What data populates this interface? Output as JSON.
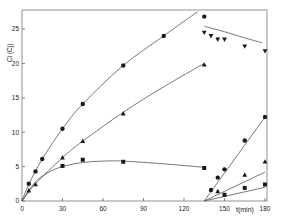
{
  "chart_data": {
    "type": "scatter",
    "title": "",
    "xlabel": "t(min)",
    "ylabel": "Ci (Cj)",
    "xlim": [
      0,
      180
    ],
    "ylim": [
      0,
      27
    ],
    "x_ticks": [
      0,
      30,
      60,
      90,
      120,
      150,
      180
    ],
    "y_ticks": [
      0,
      5,
      10,
      15,
      20,
      25
    ],
    "grid": false,
    "legend": null,
    "colors": {
      "ink": "#1a1a1a",
      "line": "#555555",
      "background": "#ffffff"
    },
    "series": [
      {
        "name": "circles",
        "marker": "circle",
        "x": [
          5,
          10,
          15,
          30,
          45,
          75,
          105,
          135
        ],
        "y": [
          2.5,
          4.3,
          6.1,
          10.5,
          14.1,
          19.7,
          24.0,
          26.8
        ],
        "fit": [
          [
            0,
            0
          ],
          [
            5,
            2.4
          ],
          [
            15,
            6.1
          ],
          [
            30,
            10.5
          ],
          [
            45,
            14.1
          ],
          [
            75,
            19.7
          ],
          [
            105,
            24.0
          ],
          [
            130,
            27.5
          ]
        ]
      },
      {
        "name": "triangles-up",
        "marker": "triangle-up",
        "x": [
          5,
          10,
          30,
          45,
          75,
          135
        ],
        "y": [
          1.5,
          2.4,
          6.3,
          8.7,
          12.7,
          19.8
        ],
        "fit": [
          [
            0,
            0
          ],
          [
            10,
            2.5
          ],
          [
            30,
            6.3
          ],
          [
            45,
            8.7
          ],
          [
            75,
            12.9
          ],
          [
            105,
            16.6
          ],
          [
            135,
            20.0
          ]
        ]
      },
      {
        "name": "squares",
        "marker": "square",
        "x": [
          30,
          45,
          75,
          135
        ],
        "y": [
          5.1,
          6.0,
          5.7,
          4.8
        ],
        "fit": [
          [
            0,
            0
          ],
          [
            10,
            2.8
          ],
          [
            20,
            4.2
          ],
          [
            30,
            5.0
          ],
          [
            45,
            5.6
          ],
          [
            60,
            5.8
          ],
          [
            75,
            5.8
          ],
          [
            105,
            5.4
          ],
          [
            135,
            4.9
          ]
        ]
      },
      {
        "name": "triangles-down",
        "marker": "triangle-down",
        "x": [
          135,
          140,
          145,
          150,
          165,
          180
        ],
        "y": [
          24.5,
          24.0,
          23.5,
          23.5,
          22.5,
          21.8
        ],
        "fit": [
          [
            135,
            25.4
          ],
          [
            150,
            24.6
          ],
          [
            165,
            23.7
          ],
          [
            178,
            23.0
          ]
        ]
      },
      {
        "name": "circles-phase2",
        "marker": "circle",
        "x": [
          140,
          145,
          150,
          165,
          180
        ],
        "y": [
          1.6,
          3.4,
          4.6,
          8.8,
          12.2
        ],
        "fit": [
          [
            135,
            0
          ],
          [
            180,
            12.2
          ]
        ]
      },
      {
        "name": "triangles-up-phase2",
        "marker": "triangle-up",
        "x": [
          145,
          165,
          180
        ],
        "y": [
          1.4,
          3.8,
          5.7
        ],
        "fit": [
          [
            135,
            0
          ],
          [
            180,
            4.2
          ]
        ]
      },
      {
        "name": "squares-phase2",
        "marker": "square",
        "x": [
          150,
          165,
          180
        ],
        "y": [
          0.9,
          1.9,
          2.4
        ],
        "fit": [
          [
            135,
            0
          ],
          [
            180,
            2.0
          ]
        ]
      }
    ]
  }
}
